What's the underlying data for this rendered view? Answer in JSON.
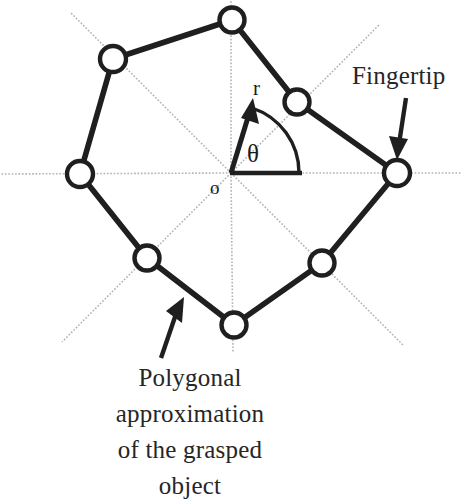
{
  "figure": {
    "background": "#ffffff",
    "ink_color": "#1f1f1f",
    "guide_color": "#b9b9b9",
    "width": 462,
    "height": 494,
    "origin": {
      "x": 231,
      "y": 173,
      "label": "o"
    },
    "axis_labels": {
      "radius": "r",
      "angle": "θ"
    },
    "annotations": [
      {
        "name": "fingertip",
        "text": "Fingertip",
        "arrow_from": {
          "x": 404,
          "y": 99
        },
        "arrow_to": {
          "x": 399,
          "y": 156
        }
      },
      {
        "name": "polygonal-approximation",
        "lines": [
          "Polygonal",
          "approximation",
          "of the grasped",
          "object"
        ],
        "arrow_from": {
          "x": 161,
          "y": 358
        },
        "arrow_to": {
          "x": 183,
          "y": 299
        }
      }
    ],
    "vertices": [
      {
        "name": "vertex-top",
        "x": 232,
        "y": 20,
        "angle_deg": 90,
        "radius": 153
      },
      {
        "name": "vertex-upper-right",
        "x": 297,
        "y": 102,
        "angle_deg": 45,
        "radius": 100
      },
      {
        "name": "vertex-right",
        "x": 397,
        "y": 173,
        "angle_deg": 0,
        "radius": 166
      },
      {
        "name": "vertex-lower-right",
        "x": 322,
        "y": 263,
        "angle_deg": -45,
        "radius": 128
      },
      {
        "name": "vertex-bottom",
        "x": 234,
        "y": 325,
        "angle_deg": -90,
        "radius": 152
      },
      {
        "name": "vertex-lower-left",
        "x": 147,
        "y": 258,
        "angle_deg": -135,
        "radius": 120
      },
      {
        "name": "vertex-left",
        "x": 80,
        "y": 174,
        "angle_deg": 180,
        "radius": 151
      },
      {
        "name": "vertex-upper-left",
        "x": 113,
        "y": 59,
        "angle_deg": 135,
        "radius": 165
      }
    ],
    "guide_rays": [
      {
        "name": "ray-0deg",
        "angle_deg": 0
      },
      {
        "name": "ray-45deg",
        "angle_deg": 45
      },
      {
        "name": "ray-90deg",
        "angle_deg": 90
      },
      {
        "name": "ray-135deg",
        "angle_deg": 135
      },
      {
        "name": "ray-180deg",
        "angle_deg": 180
      },
      {
        "name": "ray-225deg",
        "angle_deg": 225
      },
      {
        "name": "ray-270deg",
        "angle_deg": 270
      },
      {
        "name": "ray-315deg",
        "angle_deg": 315
      }
    ],
    "radius_vector": {
      "name": "radius-arrow",
      "from": {
        "x": 231,
        "y": 173
      },
      "to": {
        "x": 253,
        "y": 103
      },
      "angle_deg": 72
    },
    "angle_arc": {
      "name": "theta-arc",
      "start_deg": 0,
      "end_deg": 72,
      "radius_px": 68
    },
    "baseline": {
      "name": "theta-baseline",
      "from": {
        "x": 231,
        "y": 173
      },
      "to": {
        "x": 300,
        "y": 173
      }
    }
  }
}
